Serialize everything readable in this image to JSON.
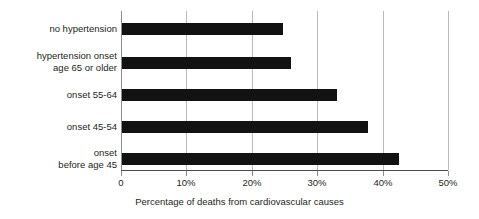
{
  "chart_data": {
    "type": "bar",
    "orientation": "horizontal",
    "title": "",
    "xlabel": "Percentage of deaths from cardiovascular causes",
    "ylabel": "",
    "categories": [
      "no hypertension",
      "hypertension onset\nage 65 or older",
      "onset 55-64",
      "onset 45-54",
      "onset\nbefore age 45"
    ],
    "values": [
      24.8,
      26.0,
      33.0,
      37.8,
      42.5
    ],
    "xlim": [
      0,
      50
    ],
    "xticks": [
      0,
      10,
      20,
      30,
      40,
      50
    ],
    "xtick_labels": [
      "0",
      "10%",
      "20%",
      "30%",
      "40%",
      "50%"
    ],
    "grid": "vertical",
    "legend": "none",
    "bar_color": "#121212",
    "gridline_color": "#b9b9b9",
    "axis_color": "#4b4b4b",
    "background_color": "#ffffff"
  }
}
